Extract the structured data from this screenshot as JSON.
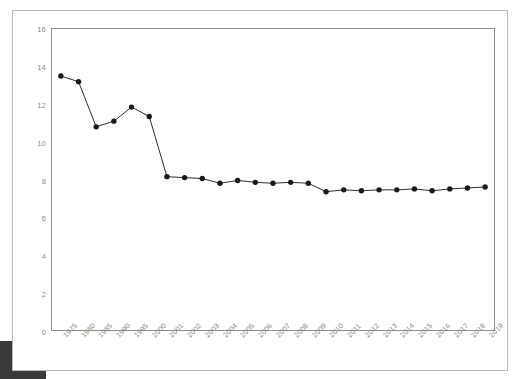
{
  "chart_data": {
    "type": "line",
    "title": "",
    "xlabel": "",
    "ylabel": "",
    "ylim": [
      0,
      16
    ],
    "yticks": [
      0,
      2,
      4,
      6,
      8,
      10,
      12,
      14,
      16
    ],
    "grid": false,
    "legend": false,
    "marker": "filled-circle",
    "line_color": "#2b2b2b",
    "marker_color": "#1a1a1a",
    "axis_color": "#8e8e8e",
    "tick_label_color": "#8a8a8a",
    "categories": [
      "1975",
      "1980",
      "1985",
      "1990",
      "1995",
      "2000",
      "2001",
      "2002",
      "2003",
      "2004",
      "2005",
      "2006",
      "2007",
      "2008",
      "2009",
      "2010",
      "2011",
      "2012",
      "2013",
      "2014",
      "2015",
      "2016",
      "2017",
      "2018",
      "2019"
    ],
    "values": [
      13.5,
      13.2,
      10.8,
      11.1,
      11.85,
      11.35,
      8.15,
      8.1,
      8.05,
      7.8,
      7.95,
      7.85,
      7.8,
      7.85,
      7.8,
      7.35,
      7.45,
      7.4,
      7.45,
      7.45,
      7.5,
      7.4,
      7.5,
      7.55,
      7.6
    ],
    "series": [
      {
        "name": "series-1",
        "values": [
          13.5,
          13.2,
          10.8,
          11.1,
          11.85,
          11.35,
          8.15,
          8.1,
          8.05,
          7.8,
          7.95,
          7.85,
          7.8,
          7.85,
          7.8,
          7.35,
          7.45,
          7.4,
          7.45,
          7.45,
          7.5,
          7.4,
          7.5,
          7.55,
          7.6
        ]
      }
    ]
  },
  "card": {
    "background": "#ffffff",
    "border_color": "#b9b9b9"
  },
  "corner_block": {
    "color": "#3a3a3a"
  }
}
